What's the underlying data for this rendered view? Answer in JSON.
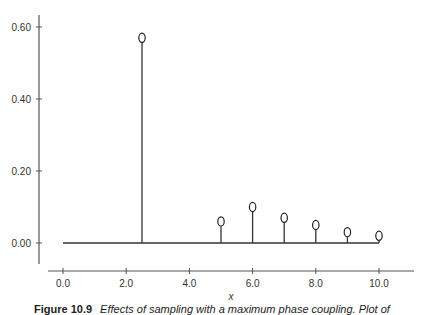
{
  "chart_data": {
    "type": "stem",
    "title": "",
    "xlabel": "x",
    "ylabel": "",
    "xlim": [
      -0.8,
      11.2
    ],
    "ylim": [
      -0.06,
      0.64
    ],
    "grid": false,
    "legend": null,
    "x_ticks": [
      "0.0",
      "2.0",
      "4.0",
      "6.0",
      "8.0",
      "10.0"
    ],
    "y_ticks": [
      "0.00",
      "0.20",
      "0.40",
      "0.60"
    ],
    "baseline": {
      "from": 0,
      "to": 10,
      "y": 0
    },
    "marker": "open-ellipse",
    "points": [
      {
        "x": 2.5,
        "y": 0.57
      },
      {
        "x": 5,
        "y": 0.06
      },
      {
        "x": 6,
        "y": 0.1
      },
      {
        "x": 7,
        "y": 0.07
      },
      {
        "x": 8,
        "y": 0.05
      },
      {
        "x": 9,
        "y": 0.03
      },
      {
        "x": 10,
        "y": 0.02
      }
    ],
    "colors": {
      "line": "#333333",
      "marker": "#222222",
      "axis": "#555555"
    }
  },
  "caption": {
    "figure_label": "Figure 10.9",
    "text": "Effects of sampling with a maximum phase coupling. Plot of"
  }
}
